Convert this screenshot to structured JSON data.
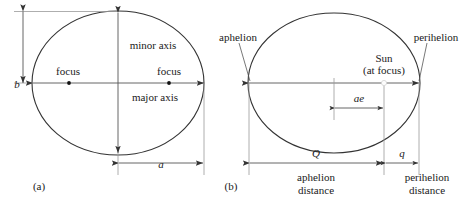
{
  "figure": {
    "stroke_color": "#333333",
    "text_color": "#1a1a1a",
    "background": "#ffffff",
    "width": 466,
    "height": 206
  },
  "panel_a": {
    "caption": "(a)",
    "labels": {
      "semi_minor": "b",
      "semi_major": "a",
      "minor_axis": "minor axis",
      "major_axis": "major axis",
      "focus_left": "focus",
      "focus_right": "focus"
    }
  },
  "panel_b": {
    "caption": "(b)",
    "labels": {
      "aphelion": "aphelion",
      "perihelion": "perihelion",
      "sun_line1": "Sun",
      "sun_line2": "(at focus)",
      "ae": "ae",
      "Q": "Q",
      "q": "q",
      "aphelion_distance_line1": "aphelion",
      "aphelion_distance_line2": "distance",
      "perihelion_distance_line1": "perihelion",
      "perihelion_distance_line2": "distance"
    }
  }
}
